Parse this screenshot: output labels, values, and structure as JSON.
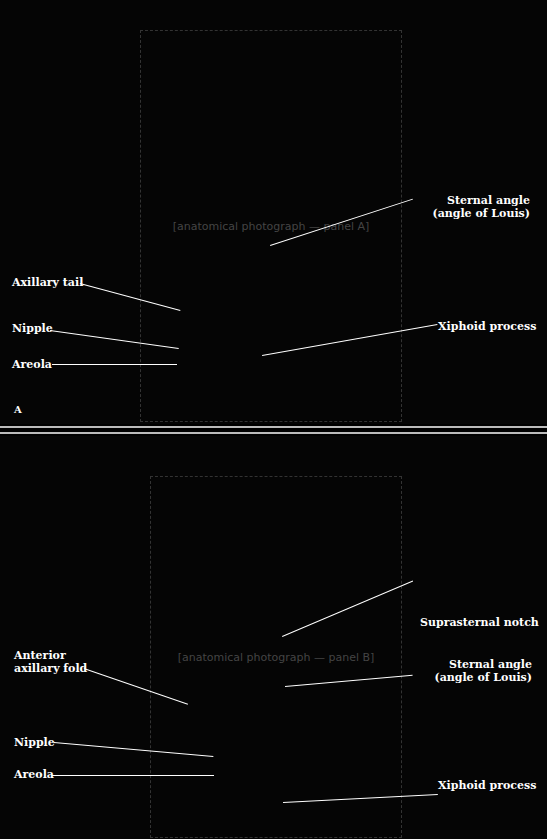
{
  "panel_a": {
    "letter": "A",
    "placeholder": "[anatomical photograph — panel A]",
    "labels": {
      "sternal_angle_1": "Sternal angle",
      "sternal_angle_2": "(angle of Louis)",
      "axillary_tail": "Axillary tail",
      "nipple": "Nipple",
      "areola": "Areola",
      "xiphoid": "Xiphoid process"
    }
  },
  "panel_b": {
    "placeholder": "[anatomical photograph — panel B]",
    "labels": {
      "suprasternal_notch": "Suprasternal notch",
      "sternal_angle_1": "Sternal angle",
      "sternal_angle_2": "(angle of Louis)",
      "anterior_axillary_fold_1": "Anterior",
      "anterior_axillary_fold_2": "axillary fold",
      "nipple": "Nipple",
      "areola": "Areola",
      "xiphoid": "Xiphoid process"
    }
  }
}
